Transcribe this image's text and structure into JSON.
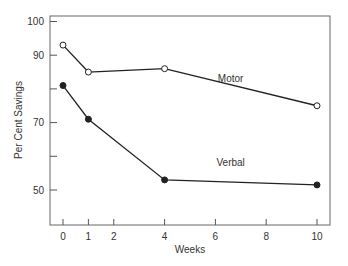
{
  "chart_data": {
    "type": "line",
    "title": "",
    "xlabel": "Weeks",
    "ylabel": "Per Cent Savings",
    "x": [
      0,
      1,
      4,
      10
    ],
    "x_ticks": [
      0,
      1,
      2,
      4,
      6,
      8,
      10
    ],
    "y_ticks": [
      50,
      60,
      70,
      80,
      90,
      100
    ],
    "y_tick_labels": [
      "50",
      "",
      "70",
      "",
      "90",
      "100"
    ],
    "xlim": [
      -0.5,
      10.5
    ],
    "ylim": [
      40,
      102
    ],
    "grid": false,
    "legend": "inline labels",
    "series": [
      {
        "name": "Motor",
        "marker": "open-circle",
        "values": [
          93,
          85,
          86,
          75
        ]
      },
      {
        "name": "Verbal",
        "marker": "filled-circle",
        "values": [
          81,
          71,
          53,
          51.5
        ]
      }
    ],
    "annotations": [
      {
        "text": "Motor",
        "x": 6.6,
        "y": 82
      },
      {
        "text": "Verbal",
        "x": 6.6,
        "y": 57
      }
    ],
    "colors": {
      "line": "#222222",
      "frame": "#555555",
      "background": "#ffffff"
    }
  }
}
